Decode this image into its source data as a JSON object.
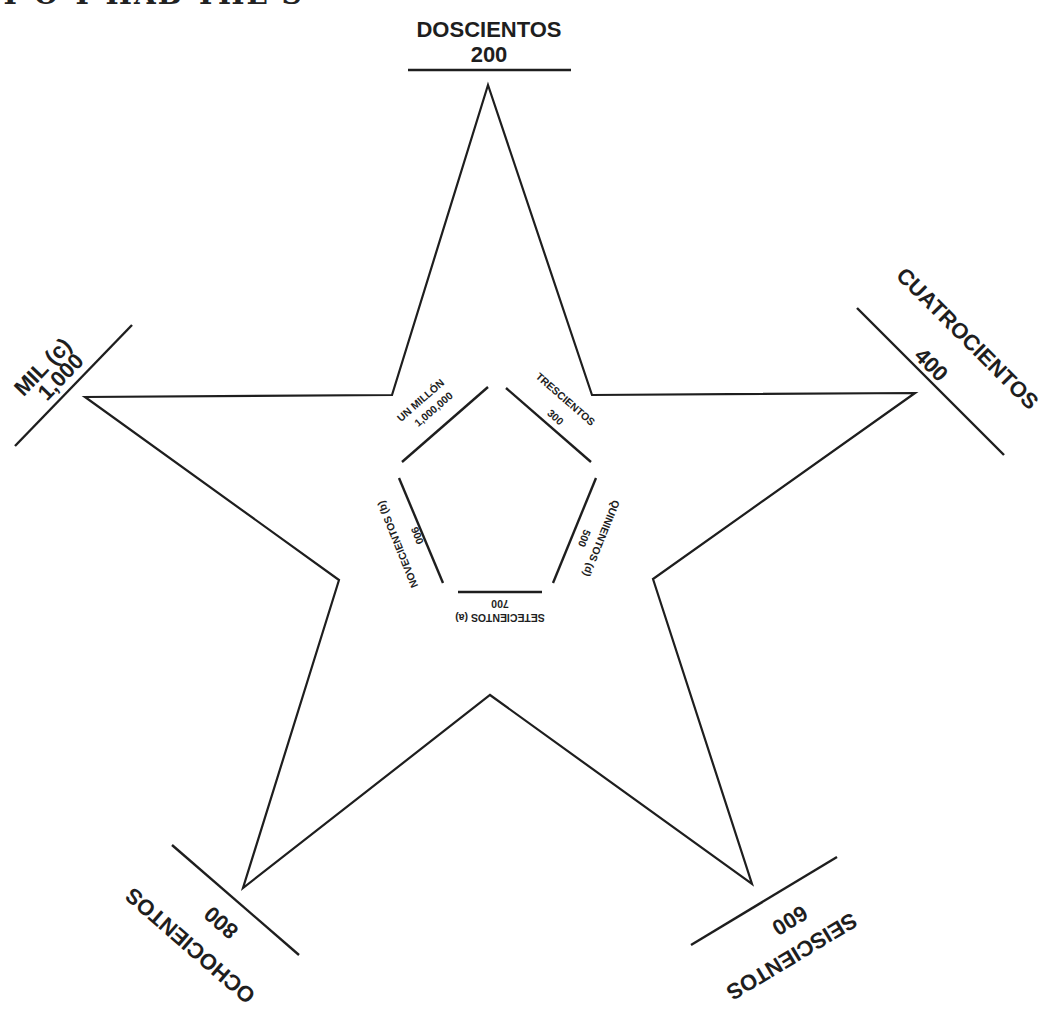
{
  "header": {
    "title_fragment": "Y O Y HAB THE STAR"
  },
  "star": {
    "outer_points": [
      [
        488,
        85
      ],
      [
        592,
        395
      ],
      [
        915,
        393
      ],
      [
        653,
        579
      ],
      [
        752,
        884
      ],
      [
        490,
        695
      ],
      [
        243,
        888
      ],
      [
        339,
        580
      ],
      [
        85,
        397
      ],
      [
        392,
        395
      ]
    ],
    "stroke_color": "#1e1e1e"
  },
  "outer_labels": [
    {
      "id": "doscientos",
      "word": "DOSCIENTOS",
      "number": "200"
    },
    {
      "id": "cuatrocientos",
      "word": "CUATROCIENTOS",
      "number": "400"
    },
    {
      "id": "seiscientos",
      "word": "SEISCIENTOS",
      "number": "600"
    },
    {
      "id": "ochocientos",
      "word": "OCHOCIENTOS",
      "number": "800"
    },
    {
      "id": "mil",
      "word": "MIL (c)",
      "number": "1,000"
    }
  ],
  "inner_labels": [
    {
      "id": "un-millon",
      "word": "UN MILLÓN",
      "number": "1,000,000"
    },
    {
      "id": "trescientos",
      "word": "TRESCIENTOS",
      "number": "300"
    },
    {
      "id": "quinientos",
      "word": "QUINIENTOS (d)",
      "number": "500"
    },
    {
      "id": "setecientos",
      "word": "SETECIENTOS (a)",
      "number": "700"
    },
    {
      "id": "novecientos",
      "word": "NOVECIENTOS (b)",
      "number": "900"
    }
  ]
}
